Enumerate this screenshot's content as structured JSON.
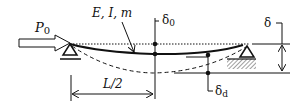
{
  "diagram": {
    "type": "beam-buckling-schematic",
    "labels": {
      "load": "P",
      "load_sub": "0",
      "properties": "E, I, m",
      "delta_zero": "δ",
      "delta_zero_sub": "0",
      "delta_d": "δ",
      "delta_d_sub": "d",
      "delta": "δ",
      "half_length": "L/2"
    },
    "elements": [
      "axial load arrow (hollow)",
      "pin support (left)",
      "roller/fixed support with hatching (right)",
      "initial straight reference line (dotted)",
      "deflected beam shape (solid)",
      "further deflected shape (dashed)",
      "midspan deflection markers δ0",
      "deflection marker δd",
      "total displacement dimension δ",
      "half-span dimension L/2"
    ],
    "colors": {
      "stroke": "#111111",
      "background": "#ffffff"
    }
  }
}
